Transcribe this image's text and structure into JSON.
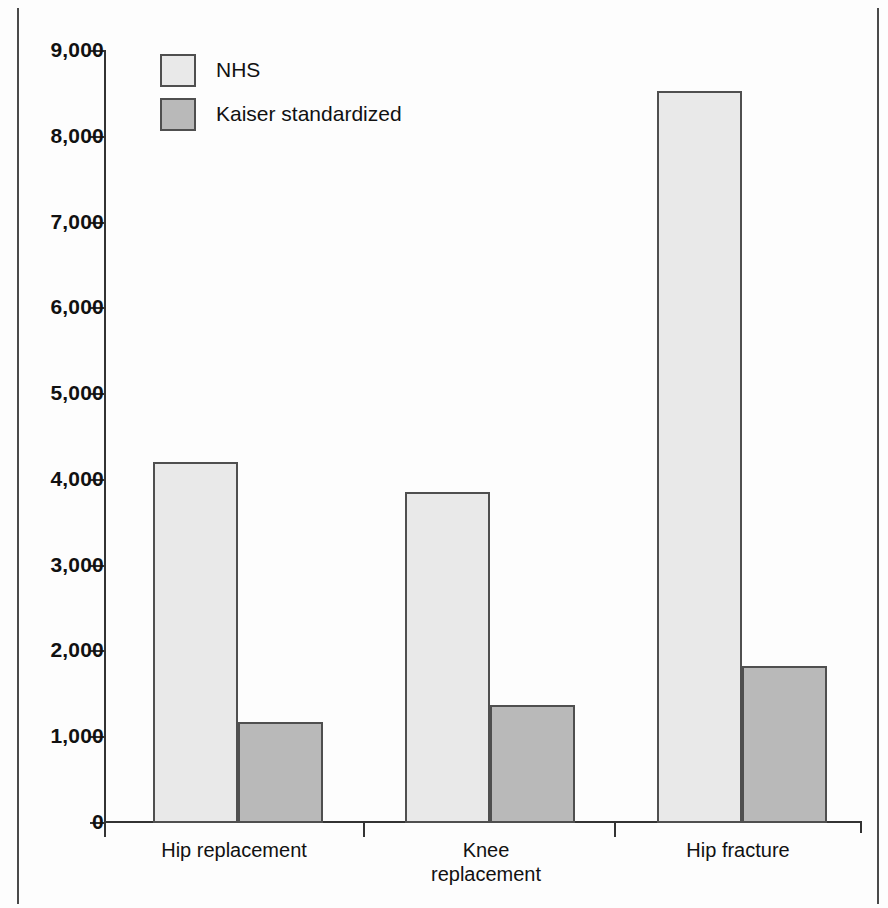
{
  "chart_data": {
    "type": "bar",
    "title": "",
    "subtitle": "",
    "xlabel": "",
    "ylabel": "",
    "ylim": [
      0,
      9000
    ],
    "grid": false,
    "legend_position": "top-left",
    "categories": [
      "Hip replacement",
      "Knee replacement",
      "Hip fracture"
    ],
    "category_lines": [
      [
        "Hip replacement"
      ],
      [
        "Knee",
        "replacement"
      ],
      [
        "Hip fracture"
      ]
    ],
    "series": [
      {
        "name": "NHS",
        "color": "#e9e9e9",
        "values": [
          4200,
          3850,
          8520
        ]
      },
      {
        "name": "Kaiser standardized",
        "color": "#b9b9b9",
        "values": [
          1170,
          1360,
          1820
        ]
      }
    ],
    "y_ticks": [
      {
        "value": 9000,
        "label": "9,000"
      },
      {
        "value": 8000,
        "label": "8,000"
      },
      {
        "value": 7000,
        "label": "7,000"
      },
      {
        "value": 6000,
        "label": "6,000"
      },
      {
        "value": 5000,
        "label": "5,000"
      },
      {
        "value": 4000,
        "label": "4,000"
      },
      {
        "value": 3000,
        "label": "3,000"
      },
      {
        "value": 2000,
        "label": "2,000"
      },
      {
        "value": 1000,
        "label": "1,000"
      },
      {
        "value": 0,
        "label": "0"
      }
    ]
  },
  "legend": {
    "items": [
      {
        "label": "NHS"
      },
      {
        "label": "Kaiser standardized"
      }
    ]
  },
  "colors": {
    "series_nhs": "#e9e9e9",
    "series_kaiser": "#b9b9b9",
    "axis": "#333333",
    "bar_outline": "#4f4f4f",
    "frame": "#4a4a4a",
    "text": "#111111",
    "background": "#fdfdfd"
  }
}
